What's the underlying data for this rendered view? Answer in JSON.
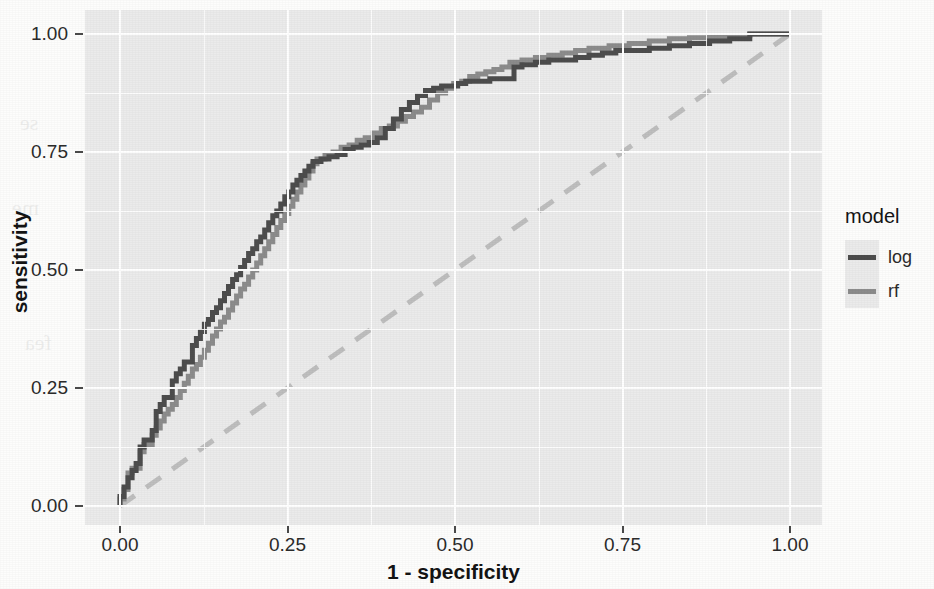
{
  "chart_data": {
    "type": "line",
    "title": "",
    "subtitle": "",
    "xlabel": "1 - specificity",
    "ylabel": "sensitivity",
    "xlim": [
      0.0,
      1.0
    ],
    "ylim": [
      0.0,
      1.0
    ],
    "xticks": [
      "0.00",
      "0.25",
      "0.50",
      "0.75",
      "1.00"
    ],
    "xtick_values": [
      0.0,
      0.25,
      0.5,
      0.75,
      1.0
    ],
    "yticks": [
      "0.00",
      "0.25",
      "0.50",
      "0.75",
      "1.00"
    ],
    "ytick_values": [
      0.0,
      0.25,
      0.5,
      0.75,
      1.0
    ],
    "grid": true,
    "panel_background": "#EBEBEB",
    "gridline_color": "#FFFFFF",
    "legend": {
      "title": "model",
      "position": "right",
      "entries": [
        {
          "name": "log",
          "color": "#4D4D4D",
          "linetype": "solid"
        },
        {
          "name": "rf",
          "color": "#8C8C8C",
          "linetype": "solid"
        }
      ]
    },
    "reference_line": {
      "name": "chance-diagonal",
      "from": [
        0.0,
        0.0
      ],
      "to": [
        1.0,
        1.0
      ],
      "color": "#BEBEBE",
      "linetype": "dashed"
    },
    "series": [
      {
        "name": "log",
        "color": "#4D4D4D",
        "linetype": "solid",
        "step": true,
        "x": [
          0.0,
          0.0,
          0.006,
          0.006,
          0.012,
          0.012,
          0.018,
          0.018,
          0.024,
          0.024,
          0.03,
          0.03,
          0.036,
          0.042,
          0.048,
          0.048,
          0.054,
          0.054,
          0.06,
          0.066,
          0.072,
          0.078,
          0.078,
          0.084,
          0.09,
          0.096,
          0.102,
          0.108,
          0.108,
          0.114,
          0.12,
          0.126,
          0.132,
          0.138,
          0.144,
          0.15,
          0.156,
          0.162,
          0.168,
          0.174,
          0.18,
          0.186,
          0.192,
          0.198,
          0.204,
          0.21,
          0.216,
          0.222,
          0.228,
          0.234,
          0.24,
          0.246,
          0.252,
          0.258,
          0.264,
          0.27,
          0.276,
          0.282,
          0.288,
          0.3,
          0.312,
          0.324,
          0.336,
          0.348,
          0.36,
          0.372,
          0.384,
          0.396,
          0.408,
          0.42,
          0.432,
          0.444,
          0.456,
          0.468,
          0.48,
          0.492,
          0.504,
          0.516,
          0.528,
          0.54,
          0.552,
          0.564,
          0.576,
          0.588,
          0.6,
          0.62,
          0.64,
          0.66,
          0.68,
          0.7,
          0.72,
          0.74,
          0.76,
          0.79,
          0.82,
          0.85,
          0.88,
          0.91,
          0.94,
          0.97,
          1.0
        ],
        "y": [
          0.0,
          0.02,
          0.02,
          0.04,
          0.04,
          0.06,
          0.06,
          0.075,
          0.075,
          0.09,
          0.09,
          0.11,
          0.125,
          0.14,
          0.14,
          0.16,
          0.16,
          0.185,
          0.2,
          0.215,
          0.23,
          0.23,
          0.25,
          0.265,
          0.28,
          0.29,
          0.305,
          0.305,
          0.325,
          0.34,
          0.355,
          0.37,
          0.385,
          0.395,
          0.41,
          0.42,
          0.435,
          0.45,
          0.465,
          0.48,
          0.49,
          0.505,
          0.52,
          0.535,
          0.545,
          0.56,
          0.57,
          0.585,
          0.6,
          0.615,
          0.625,
          0.64,
          0.655,
          0.665,
          0.68,
          0.69,
          0.7,
          0.71,
          0.72,
          0.73,
          0.735,
          0.74,
          0.745,
          0.755,
          0.76,
          0.765,
          0.77,
          0.78,
          0.8,
          0.82,
          0.84,
          0.855,
          0.87,
          0.88,
          0.885,
          0.89,
          0.89,
          0.895,
          0.9,
          0.9,
          0.9,
          0.905,
          0.905,
          0.905,
          0.93,
          0.935,
          0.94,
          0.945,
          0.945,
          0.95,
          0.955,
          0.96,
          0.965,
          0.965,
          0.97,
          0.975,
          0.98,
          0.985,
          0.99,
          1.0,
          1.0
        ]
      },
      {
        "name": "rf",
        "color": "#8C8C8C",
        "linetype": "solid",
        "step": true,
        "x": [
          0.0,
          0.0,
          0.006,
          0.006,
          0.012,
          0.012,
          0.018,
          0.024,
          0.03,
          0.03,
          0.036,
          0.042,
          0.048,
          0.054,
          0.06,
          0.066,
          0.072,
          0.078,
          0.084,
          0.09,
          0.096,
          0.102,
          0.108,
          0.114,
          0.12,
          0.126,
          0.132,
          0.138,
          0.144,
          0.15,
          0.156,
          0.162,
          0.168,
          0.174,
          0.18,
          0.186,
          0.192,
          0.198,
          0.204,
          0.21,
          0.216,
          0.222,
          0.228,
          0.234,
          0.24,
          0.246,
          0.252,
          0.258,
          0.264,
          0.27,
          0.276,
          0.282,
          0.288,
          0.294,
          0.306,
          0.318,
          0.33,
          0.342,
          0.354,
          0.366,
          0.378,
          0.39,
          0.402,
          0.414,
          0.426,
          0.438,
          0.45,
          0.462,
          0.474,
          0.486,
          0.498,
          0.51,
          0.522,
          0.534,
          0.546,
          0.558,
          0.57,
          0.582,
          0.6,
          0.62,
          0.64,
          0.66,
          0.68,
          0.7,
          0.73,
          0.76,
          0.79,
          0.82,
          0.85,
          0.88,
          0.91,
          0.94,
          0.97,
          1.0
        ],
        "y": [
          0.0,
          0.015,
          0.015,
          0.035,
          0.035,
          0.055,
          0.07,
          0.08,
          0.08,
          0.1,
          0.115,
          0.13,
          0.13,
          0.15,
          0.165,
          0.18,
          0.195,
          0.205,
          0.215,
          0.23,
          0.245,
          0.26,
          0.275,
          0.29,
          0.3,
          0.315,
          0.33,
          0.345,
          0.36,
          0.375,
          0.39,
          0.4,
          0.415,
          0.43,
          0.445,
          0.46,
          0.47,
          0.485,
          0.5,
          0.515,
          0.53,
          0.545,
          0.56,
          0.575,
          0.59,
          0.605,
          0.62,
          0.635,
          0.65,
          0.665,
          0.68,
          0.695,
          0.71,
          0.725,
          0.735,
          0.745,
          0.75,
          0.76,
          0.765,
          0.775,
          0.78,
          0.79,
          0.8,
          0.805,
          0.815,
          0.825,
          0.835,
          0.845,
          0.86,
          0.875,
          0.885,
          0.895,
          0.9,
          0.91,
          0.915,
          0.92,
          0.925,
          0.93,
          0.94,
          0.945,
          0.95,
          0.955,
          0.96,
          0.965,
          0.97,
          0.975,
          0.98,
          0.985,
          0.99,
          0.992,
          0.995,
          0.997,
          1.0,
          1.0
        ]
      }
    ]
  },
  "axis": {
    "x_title": "1 - specificity",
    "y_title": "sensitivity",
    "x_ticks": [
      "0.00",
      "0.25",
      "0.50",
      "0.75",
      "1.00"
    ],
    "y_ticks": [
      "1.00",
      "0.75",
      "0.50",
      "0.25",
      "0.00"
    ]
  },
  "legend": {
    "title": "model",
    "items": [
      {
        "label": "log",
        "color": "#4D4D4D"
      },
      {
        "label": "rf",
        "color": "#8C8C8C"
      }
    ]
  },
  "background_showthrough": {
    "lines": [
      "assess",
      "ble. Ran",
      "ses in sp",
      "odel pro",
      "se",
      "me",
      "fea",
      "log",
      "rf"
    ]
  }
}
